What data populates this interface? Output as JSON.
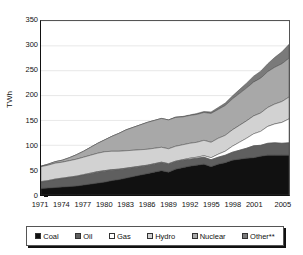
{
  "chart_data": {
    "type": "area",
    "stacked": true,
    "title": "",
    "xlabel": "",
    "ylabel": "TWh",
    "ylim": [
      0,
      350
    ],
    "ytick_values": [
      0,
      50,
      100,
      150,
      200,
      250,
      300,
      350
    ],
    "ytick_labels": [
      "0",
      "50",
      "100",
      "150",
      "200",
      "250",
      "300",
      "350"
    ],
    "grid": true,
    "legend_position": "bottom",
    "x": [
      1971,
      1972,
      1973,
      1974,
      1975,
      1976,
      1977,
      1978,
      1979,
      1980,
      1981,
      1982,
      1983,
      1984,
      1985,
      1986,
      1987,
      1988,
      1989,
      1990,
      1991,
      1992,
      1993,
      1994,
      1995,
      1996,
      1997,
      1998,
      1999,
      2000,
      2001,
      2002,
      2003,
      2004,
      2005,
      2006
    ],
    "xtick_labels": [
      "1971",
      "1974",
      "1977",
      "1980",
      "1983",
      "1986",
      "1989",
      "1992",
      "1995",
      "1998",
      "2001",
      "2005"
    ],
    "xtick_years": [
      1971,
      1974,
      1977,
      1980,
      1983,
      1986,
      1989,
      1992,
      1995,
      1998,
      2001,
      2005
    ],
    "series": [
      {
        "name": "Coal",
        "color": "#111111",
        "values": [
          13,
          14,
          15,
          16,
          17,
          18,
          20,
          22,
          24,
          26,
          29,
          31,
          34,
          37,
          40,
          43,
          46,
          49,
          46,
          52,
          55,
          58,
          60,
          62,
          57,
          62,
          65,
          70,
          72,
          74,
          75,
          78,
          80,
          80,
          80,
          80
        ]
      },
      {
        "name": "Oil",
        "color": "#5f5f5f",
        "values": [
          13,
          14,
          16,
          17,
          18,
          19,
          20,
          21,
          22,
          22,
          21,
          20,
          19,
          18,
          17,
          16,
          16,
          16,
          16,
          15,
          15,
          14,
          14,
          14,
          14,
          14,
          15,
          16,
          18,
          20,
          24,
          22,
          24,
          25,
          24,
          25
        ]
      },
      {
        "name": "Gas",
        "color": "#ffffff",
        "values": [
          1,
          1,
          1,
          1,
          1,
          1,
          1,
          1,
          1,
          1,
          1,
          1,
          1,
          1,
          1,
          1,
          1,
          1,
          1,
          1,
          1,
          2,
          2,
          3,
          4,
          6,
          8,
          12,
          16,
          20,
          24,
          28,
          34,
          38,
          42,
          48
        ]
      },
      {
        "name": "Hydro",
        "color": "#d2d2d2",
        "values": [
          30,
          31,
          32,
          32,
          33,
          34,
          35,
          36,
          37,
          38,
          37,
          36,
          35,
          34,
          33,
          32,
          31,
          30,
          30,
          30,
          30,
          30,
          30,
          31,
          31,
          32,
          32,
          33,
          34,
          35,
          36,
          37,
          38,
          40,
          42,
          44
        ]
      },
      {
        "name": "Nuclear",
        "color": "#a8a8a8",
        "values": [
          1,
          2,
          3,
          4,
          6,
          9,
          12,
          16,
          20,
          24,
          30,
          36,
          42,
          46,
          50,
          54,
          56,
          58,
          58,
          58,
          56,
          56,
          56,
          56,
          58,
          58,
          60,
          62,
          64,
          66,
          68,
          70,
          72,
          74,
          76,
          78
        ]
      },
      {
        "name": "Other**",
        "color": "#7a7a7a",
        "values": [
          0,
          0,
          0,
          0,
          0,
          0,
          0,
          0,
          0,
          0,
          0,
          0,
          0,
          0,
          0,
          0,
          0,
          0,
          0,
          1,
          1,
          1,
          2,
          2,
          3,
          4,
          5,
          6,
          8,
          10,
          12,
          14,
          16,
          20,
          24,
          28
        ]
      }
    ],
    "totals": [
      58,
      62,
      67,
      70,
      75,
      81,
      88,
      96,
      104,
      111,
      118,
      124,
      131,
      136,
      141,
      146,
      150,
      153,
      151,
      156,
      158,
      161,
      164,
      168,
      167,
      176,
      185,
      199,
      212,
      225,
      239,
      249,
      264,
      277,
      288,
      303
    ]
  },
  "legend": {
    "items": [
      {
        "label": "Coal",
        "color": "#111111"
      },
      {
        "label": "Oil",
        "color": "#5f5f5f"
      },
      {
        "label": "Gas",
        "color": "#ffffff"
      },
      {
        "label": "Hydro",
        "color": "#d2d2d2"
      },
      {
        "label": "Nuclear",
        "color": "#a8a8a8"
      },
      {
        "label": "Other**",
        "color": "#7a7a7a"
      }
    ]
  }
}
